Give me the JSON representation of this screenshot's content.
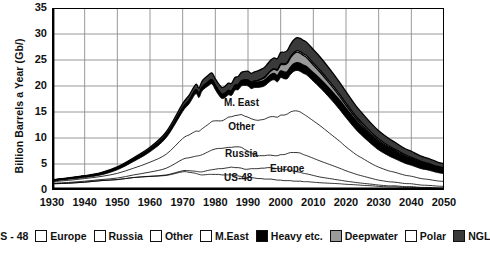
{
  "chart_data": {
    "type": "area",
    "title": "",
    "subtitle": "",
    "xlabel": "",
    "ylabel": "Billion Barrels a Year (Gb/)",
    "xlim": [
      1930,
      2050
    ],
    "ylim": [
      0,
      35
    ],
    "ytick_step": 5,
    "xtick_step": 10,
    "grid": true,
    "stacked": true,
    "legend_position": "bottom",
    "yticks": [
      "0",
      "5",
      "10",
      "15",
      "20",
      "25",
      "30",
      "35"
    ],
    "xticks": [
      "1930",
      "1940",
      "1950",
      "1960",
      "1970",
      "1980",
      "1990",
      "2000",
      "2010",
      "2020",
      "2030",
      "2040",
      "2050"
    ],
    "inline_annotations": [
      {
        "text": "M. East",
        "x": 1988,
        "y": 16.2
      },
      {
        "text": "Other",
        "x": 1988,
        "y": 11.6
      },
      {
        "text": "Russia",
        "x": 1988,
        "y": 6.4
      },
      {
        "text": "Europe",
        "x": 2002,
        "y": 3.5
      },
      {
        "text": "US-48",
        "x": 1987,
        "y": 1.7
      }
    ],
    "x": [
      1930,
      1935,
      1940,
      1945,
      1950,
      1955,
      1960,
      1965,
      1970,
      1972,
      1974,
      1975,
      1976,
      1978,
      1979,
      1980,
      1981,
      1982,
      1983,
      1984,
      1985,
      1986,
      1987,
      1988,
      1989,
      1990,
      1991,
      1992,
      1993,
      1994,
      1995,
      1996,
      1997,
      1998,
      1999,
      2000,
      2001,
      2002,
      2003,
      2004,
      2005,
      2006,
      2007,
      2008,
      2010,
      2012,
      2015,
      2018,
      2020,
      2023,
      2025,
      2028,
      2030,
      2033,
      2035,
      2038,
      2040,
      2043,
      2045,
      2048,
      2050
    ],
    "series": [
      {
        "name": "US - 48",
        "color": "#ffffff",
        "values": [
          1.2,
          1.3,
          1.5,
          1.8,
          2.0,
          2.4,
          2.6,
          2.8,
          3.5,
          3.4,
          3.2,
          3.0,
          2.9,
          3.0,
          3.0,
          3.0,
          3.0,
          2.9,
          2.9,
          2.9,
          2.9,
          2.8,
          2.7,
          2.6,
          2.5,
          2.4,
          2.4,
          2.3,
          2.2,
          2.2,
          2.1,
          2.1,
          2.1,
          2.0,
          1.9,
          1.9,
          1.8,
          1.8,
          1.8,
          1.7,
          1.7,
          1.7,
          1.6,
          1.6,
          1.5,
          1.4,
          1.3,
          1.2,
          1.1,
          1.0,
          0.9,
          0.8,
          0.7,
          0.6,
          0.6,
          0.5,
          0.5,
          0.4,
          0.4,
          0.3,
          0.3
        ]
      },
      {
        "name": "Europe",
        "color": "#ffffff",
        "values": [
          0.0,
          0.0,
          0.0,
          0.0,
          0.0,
          0.0,
          0.05,
          0.1,
          0.2,
          0.3,
          0.4,
          0.5,
          0.6,
          0.8,
          0.9,
          1.0,
          1.1,
          1.2,
          1.3,
          1.4,
          1.5,
          1.5,
          1.6,
          1.6,
          1.5,
          1.6,
          1.7,
          1.8,
          1.9,
          2.0,
          2.1,
          2.2,
          2.2,
          2.2,
          2.2,
          2.2,
          2.1,
          2.1,
          2.0,
          1.9,
          1.8,
          1.7,
          1.6,
          1.5,
          1.3,
          1.1,
          0.9,
          0.7,
          0.6,
          0.45,
          0.4,
          0.3,
          0.25,
          0.2,
          0.2,
          0.15,
          0.15,
          0.1,
          0.1,
          0.1,
          0.1
        ]
      },
      {
        "name": "Russia",
        "color": "#ffffff",
        "values": [
          0.1,
          0.15,
          0.2,
          0.2,
          0.3,
          0.5,
          0.8,
          1.3,
          2.2,
          2.5,
          2.9,
          3.1,
          3.3,
          3.6,
          3.8,
          3.9,
          3.9,
          3.9,
          3.9,
          3.9,
          3.8,
          4.0,
          4.0,
          4.0,
          3.8,
          3.5,
          3.0,
          2.7,
          2.5,
          2.4,
          2.4,
          2.4,
          2.4,
          2.4,
          2.5,
          2.7,
          2.9,
          3.1,
          3.4,
          3.6,
          3.7,
          3.7,
          3.6,
          3.5,
          3.3,
          3.1,
          2.7,
          2.3,
          2.0,
          1.6,
          1.4,
          1.1,
          0.95,
          0.8,
          0.7,
          0.6,
          0.55,
          0.45,
          0.4,
          0.35,
          0.3
        ]
      },
      {
        "name": "Other",
        "color": "#ffffff",
        "values": [
          0.3,
          0.4,
          0.5,
          0.6,
          0.9,
          1.3,
          1.9,
          2.7,
          4.0,
          4.4,
          4.8,
          4.7,
          5.0,
          5.3,
          5.5,
          5.4,
          5.3,
          5.3,
          5.5,
          5.8,
          5.9,
          6.0,
          6.1,
          6.3,
          6.4,
          6.5,
          6.6,
          6.7,
          6.8,
          6.9,
          7.0,
          7.2,
          7.4,
          7.5,
          7.4,
          7.6,
          7.6,
          7.6,
          7.8,
          8.0,
          8.0,
          7.9,
          7.8,
          7.6,
          7.2,
          6.8,
          6.0,
          5.2,
          4.6,
          3.8,
          3.4,
          2.8,
          2.5,
          2.1,
          1.9,
          1.6,
          1.45,
          1.25,
          1.15,
          1.0,
          0.95
        ]
      },
      {
        "name": "M.East",
        "color": "#ffffff",
        "values": [
          0.1,
          0.2,
          0.2,
          0.3,
          0.7,
          1.3,
          2.0,
          3.2,
          5.2,
          6.0,
          7.2,
          6.5,
          7.3,
          7.4,
          7.2,
          6.0,
          5.0,
          4.3,
          4.2,
          4.3,
          4.1,
          4.9,
          4.9,
          5.5,
          5.9,
          6.0,
          5.8,
          6.2,
          6.3,
          6.3,
          6.4,
          6.6,
          6.9,
          7.1,
          6.8,
          7.2,
          7.0,
          6.8,
          7.2,
          7.6,
          7.8,
          7.8,
          7.8,
          7.9,
          7.6,
          7.3,
          6.8,
          6.1,
          5.6,
          4.8,
          4.3,
          3.7,
          3.3,
          2.9,
          2.6,
          2.3,
          2.1,
          1.9,
          1.8,
          1.6,
          1.5
        ]
      },
      {
        "name": "Heavy etc.",
        "color": "#000000",
        "values": [
          0.2,
          0.2,
          0.25,
          0.3,
          0.35,
          0.4,
          0.45,
          0.5,
          0.6,
          0.65,
          0.7,
          0.7,
          0.7,
          0.75,
          0.8,
          0.8,
          0.8,
          0.8,
          0.8,
          0.85,
          0.85,
          0.9,
          0.9,
          0.95,
          0.95,
          1.0,
          1.0,
          1.0,
          1.05,
          1.1,
          1.1,
          1.15,
          1.2,
          1.2,
          1.25,
          1.3,
          1.3,
          1.35,
          1.4,
          1.45,
          1.5,
          1.55,
          1.6,
          1.6,
          1.65,
          1.7,
          1.75,
          1.8,
          1.8,
          1.75,
          1.7,
          1.6,
          1.55,
          1.45,
          1.4,
          1.3,
          1.25,
          1.15,
          1.1,
          1.0,
          0.95
        ]
      },
      {
        "name": "Deepwater",
        "color": "#9a9a9a",
        "values": [
          0.0,
          0.0,
          0.0,
          0.0,
          0.0,
          0.0,
          0.0,
          0.0,
          0.0,
          0.0,
          0.0,
          0.0,
          0.0,
          0.0,
          0.0,
          0.0,
          0.0,
          0.0,
          0.0,
          0.0,
          0.02,
          0.04,
          0.06,
          0.08,
          0.1,
          0.15,
          0.2,
          0.25,
          0.3,
          0.4,
          0.5,
          0.6,
          0.7,
          0.85,
          1.0,
          1.2,
          1.4,
          1.6,
          1.8,
          1.9,
          2.0,
          1.95,
          1.85,
          1.75,
          1.5,
          1.3,
          1.0,
          0.75,
          0.6,
          0.45,
          0.38,
          0.3,
          0.25,
          0.2,
          0.18,
          0.14,
          0.12,
          0.1,
          0.08,
          0.06,
          0.05
        ]
      },
      {
        "name": "Polar",
        "color": "#ffffff",
        "values": [
          0.0,
          0.0,
          0.0,
          0.0,
          0.0,
          0.0,
          0.0,
          0.0,
          0.0,
          0.0,
          0.0,
          0.0,
          0.0,
          0.0,
          0.0,
          0.0,
          0.0,
          0.0,
          0.0,
          0.0,
          0.0,
          0.0,
          0.0,
          0.0,
          0.0,
          0.0,
          0.02,
          0.03,
          0.04,
          0.05,
          0.06,
          0.07,
          0.08,
          0.1,
          0.12,
          0.15,
          0.18,
          0.2,
          0.22,
          0.25,
          0.28,
          0.3,
          0.32,
          0.34,
          0.36,
          0.38,
          0.4,
          0.4,
          0.4,
          0.38,
          0.36,
          0.32,
          0.3,
          0.26,
          0.24,
          0.2,
          0.18,
          0.16,
          0.14,
          0.12,
          0.1
        ]
      },
      {
        "name": "NGL",
        "color": "#3a3a3a",
        "values": [
          0.05,
          0.08,
          0.1,
          0.15,
          0.2,
          0.3,
          0.4,
          0.6,
          0.9,
          1.0,
          1.1,
          1.1,
          1.2,
          1.3,
          1.3,
          1.3,
          1.3,
          1.3,
          1.35,
          1.4,
          1.45,
          1.5,
          1.55,
          1.6,
          1.65,
          1.7,
          1.7,
          1.75,
          1.8,
          1.85,
          1.9,
          1.95,
          2.0,
          2.05,
          2.1,
          2.2,
          2.2,
          2.25,
          2.35,
          2.45,
          2.5,
          2.55,
          2.6,
          2.6,
          2.6,
          2.55,
          2.45,
          2.3,
          2.2,
          2.0,
          1.9,
          1.7,
          1.6,
          1.45,
          1.35,
          1.2,
          1.15,
          1.0,
          0.95,
          0.85,
          0.8
        ]
      }
    ]
  },
  "legend": {
    "items": [
      {
        "label": "US - 48",
        "color": "#ffffff"
      },
      {
        "label": "Europe",
        "color": "#ffffff"
      },
      {
        "label": "Russia",
        "color": "#ffffff"
      },
      {
        "label": "Other",
        "color": "#ffffff"
      },
      {
        "label": "M.East",
        "color": "#ffffff"
      },
      {
        "label": "Heavy etc.",
        "color": "#000000"
      },
      {
        "label": "Deepwater",
        "color": "#9a9a9a"
      },
      {
        "label": "Polar",
        "color": "#ffffff"
      },
      {
        "label": "NGL",
        "color": "#3a3a3a"
      }
    ]
  }
}
